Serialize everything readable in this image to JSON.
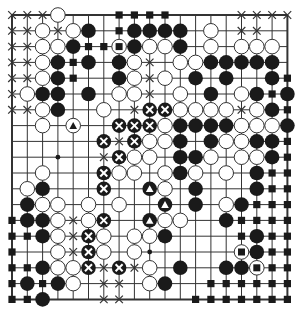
{
  "board": {
    "size": 19,
    "origin_x": 12,
    "origin_y": 15,
    "step_x": 15.3,
    "step_y": 15.8,
    "stone_radius": 7.3,
    "colors": {
      "line": "#333333",
      "black_stone": "#1a1a1a",
      "white_stone": "#ffffff",
      "stone_outline": "#333333",
      "background": "#ffffff"
    },
    "legend": {
      "W": "white stone",
      "B": "black stone",
      "X": "cross mark on empty point",
      "S": "black square on empty point",
      "D": "star point dot",
      "BX": "black stone marked with white X",
      "WT": "white stone marked with black triangle",
      "BT": "black stone marked with white triangle",
      "WS": "white stone marked with black square"
    },
    "rows": [
      {
        "row": 0,
        "points": [
          [
            0,
            "X"
          ],
          [
            1,
            "X"
          ],
          [
            2,
            "X"
          ],
          [
            3,
            "W"
          ],
          [
            7,
            "S"
          ],
          [
            8,
            "S"
          ],
          [
            9,
            "S"
          ],
          [
            10,
            "S"
          ],
          [
            15,
            "X"
          ],
          [
            16,
            "X"
          ],
          [
            17,
            "X"
          ],
          [
            18,
            "X"
          ]
        ]
      },
      {
        "row": 1,
        "points": [
          [
            0,
            "X"
          ],
          [
            1,
            "X"
          ],
          [
            2,
            "W"
          ],
          [
            3,
            "X"
          ],
          [
            4,
            "W"
          ],
          [
            5,
            "B"
          ],
          [
            7,
            "S"
          ],
          [
            8,
            "B"
          ],
          [
            9,
            "B"
          ],
          [
            10,
            "B"
          ],
          [
            11,
            "B"
          ],
          [
            13,
            "W"
          ],
          [
            15,
            "X"
          ],
          [
            16,
            "X"
          ]
        ]
      },
      {
        "row": 2,
        "points": [
          [
            0,
            "X"
          ],
          [
            1,
            "X"
          ],
          [
            2,
            "W"
          ],
          [
            3,
            "W"
          ],
          [
            4,
            "B"
          ],
          [
            5,
            "S"
          ],
          [
            6,
            "S"
          ],
          [
            7,
            "WS"
          ],
          [
            8,
            "B"
          ],
          [
            9,
            "W"
          ],
          [
            10,
            "W"
          ],
          [
            11,
            "B"
          ],
          [
            13,
            "W"
          ],
          [
            15,
            "W"
          ],
          [
            16,
            "W"
          ],
          [
            17,
            "W"
          ]
        ]
      },
      {
        "row": 3,
        "points": [
          [
            0,
            "X"
          ],
          [
            1,
            "X"
          ],
          [
            2,
            "W"
          ],
          [
            3,
            "B"
          ],
          [
            4,
            "S"
          ],
          [
            5,
            "B"
          ],
          [
            7,
            "B"
          ],
          [
            8,
            "W"
          ],
          [
            9,
            "X"
          ],
          [
            11,
            "W"
          ],
          [
            12,
            "W"
          ],
          [
            13,
            "B"
          ],
          [
            14,
            "B"
          ],
          [
            15,
            "B"
          ],
          [
            16,
            "B"
          ],
          [
            17,
            "B"
          ]
        ]
      },
      {
        "row": 4,
        "points": [
          [
            0,
            "X"
          ],
          [
            1,
            "X"
          ],
          [
            2,
            "W"
          ],
          [
            3,
            "B"
          ],
          [
            4,
            "S"
          ],
          [
            7,
            "B"
          ],
          [
            8,
            "W"
          ],
          [
            9,
            "X"
          ],
          [
            10,
            "W"
          ],
          [
            12,
            "B"
          ],
          [
            14,
            "B"
          ],
          [
            17,
            "B"
          ],
          [
            18,
            "S"
          ]
        ]
      },
      {
        "row": 5,
        "points": [
          [
            0,
            "X"
          ],
          [
            1,
            "W"
          ],
          [
            2,
            "B"
          ],
          [
            3,
            "B"
          ],
          [
            5,
            "B"
          ],
          [
            7,
            "W"
          ],
          [
            8,
            "W"
          ],
          [
            9,
            "X"
          ],
          [
            11,
            "W"
          ],
          [
            13,
            "B"
          ],
          [
            15,
            "W"
          ],
          [
            16,
            "B"
          ],
          [
            17,
            "S"
          ],
          [
            18,
            "B"
          ]
        ]
      },
      {
        "row": 6,
        "points": [
          [
            0,
            "X"
          ],
          [
            1,
            "X"
          ],
          [
            2,
            "W"
          ],
          [
            3,
            "B"
          ],
          [
            6,
            "W"
          ],
          [
            8,
            "X"
          ],
          [
            9,
            "BX"
          ],
          [
            10,
            "BX"
          ],
          [
            11,
            "W"
          ],
          [
            12,
            "W"
          ],
          [
            13,
            "W"
          ],
          [
            14,
            "W"
          ],
          [
            15,
            "X"
          ],
          [
            16,
            "W"
          ],
          [
            17,
            "B"
          ],
          [
            18,
            "S"
          ]
        ]
      },
      {
        "row": 7,
        "points": [
          [
            2,
            "W"
          ],
          [
            4,
            "WT"
          ],
          [
            7,
            "BX"
          ],
          [
            8,
            "BX"
          ],
          [
            9,
            "BX"
          ],
          [
            10,
            "W"
          ],
          [
            11,
            "B"
          ],
          [
            12,
            "B"
          ],
          [
            13,
            "B"
          ],
          [
            14,
            "B"
          ],
          [
            15,
            "W"
          ],
          [
            16,
            "W"
          ],
          [
            17,
            "W"
          ],
          [
            18,
            "B"
          ]
        ]
      },
      {
        "row": 8,
        "points": [
          [
            6,
            "BX"
          ],
          [
            7,
            "X"
          ],
          [
            8,
            "BX"
          ],
          [
            9,
            "W"
          ],
          [
            10,
            "W"
          ],
          [
            11,
            "B"
          ],
          [
            13,
            "B"
          ],
          [
            14,
            "W"
          ],
          [
            15,
            "W"
          ],
          [
            16,
            "B"
          ],
          [
            17,
            "B"
          ],
          [
            18,
            "S"
          ]
        ]
      },
      {
        "row": 9,
        "points": [
          [
            3,
            "D"
          ],
          [
            6,
            "X"
          ],
          [
            7,
            "BX"
          ],
          [
            8,
            "W"
          ],
          [
            9,
            "W"
          ],
          [
            11,
            "B"
          ],
          [
            12,
            "B"
          ],
          [
            13,
            "W"
          ],
          [
            15,
            "W"
          ],
          [
            16,
            "W"
          ],
          [
            17,
            "B"
          ],
          [
            18,
            "S"
          ]
        ]
      },
      {
        "row": 10,
        "points": [
          [
            2,
            "W"
          ],
          [
            6,
            "BX"
          ],
          [
            7,
            "W"
          ],
          [
            8,
            "W"
          ],
          [
            10,
            "W"
          ],
          [
            11,
            "B"
          ],
          [
            12,
            "W"
          ],
          [
            14,
            "W"
          ],
          [
            16,
            "B"
          ],
          [
            17,
            "S"
          ],
          [
            18,
            "S"
          ]
        ]
      },
      {
        "row": 11,
        "points": [
          [
            1,
            "W"
          ],
          [
            2,
            "B"
          ],
          [
            6,
            "BX"
          ],
          [
            9,
            "BT"
          ],
          [
            10,
            "W"
          ],
          [
            12,
            "B"
          ],
          [
            16,
            "B"
          ],
          [
            17,
            "S"
          ],
          [
            18,
            "S"
          ]
        ]
      },
      {
        "row": 12,
        "points": [
          [
            1,
            "B"
          ],
          [
            2,
            "W"
          ],
          [
            3,
            "W"
          ],
          [
            5,
            "W"
          ],
          [
            7,
            "W"
          ],
          [
            10,
            "BT"
          ],
          [
            12,
            "B"
          ],
          [
            14,
            "W"
          ],
          [
            15,
            "B"
          ],
          [
            16,
            "S"
          ],
          [
            17,
            "S"
          ],
          [
            18,
            "S"
          ]
        ]
      },
      {
        "row": 13,
        "points": [
          [
            0,
            "S"
          ],
          [
            1,
            "B"
          ],
          [
            2,
            "B"
          ],
          [
            3,
            "W"
          ],
          [
            4,
            "X"
          ],
          [
            5,
            "W"
          ],
          [
            6,
            "BX"
          ],
          [
            9,
            "BT"
          ],
          [
            10,
            "W"
          ],
          [
            11,
            "W"
          ],
          [
            14,
            "B"
          ],
          [
            15,
            "S"
          ],
          [
            16,
            "S"
          ],
          [
            17,
            "S"
          ],
          [
            18,
            "S"
          ]
        ]
      },
      {
        "row": 14,
        "points": [
          [
            0,
            "S"
          ],
          [
            1,
            "S"
          ],
          [
            2,
            "B"
          ],
          [
            3,
            "W"
          ],
          [
            4,
            "X"
          ],
          [
            5,
            "BX"
          ],
          [
            6,
            "W"
          ],
          [
            8,
            "W"
          ],
          [
            9,
            "W"
          ],
          [
            10,
            "B"
          ],
          [
            15,
            "S"
          ],
          [
            16,
            "B"
          ],
          [
            17,
            "S"
          ],
          [
            18,
            "S"
          ]
        ]
      },
      {
        "row": 15,
        "points": [
          [
            0,
            "S"
          ],
          [
            3,
            "W"
          ],
          [
            4,
            "X"
          ],
          [
            5,
            "BX"
          ],
          [
            6,
            "W"
          ],
          [
            8,
            "W"
          ],
          [
            9,
            "D"
          ],
          [
            15,
            "WS"
          ],
          [
            16,
            "B"
          ],
          [
            17,
            "S"
          ],
          [
            18,
            "S"
          ]
        ]
      },
      {
        "row": 16,
        "points": [
          [
            0,
            "S"
          ],
          [
            1,
            "S"
          ],
          [
            2,
            "B"
          ],
          [
            3,
            "W"
          ],
          [
            4,
            "W"
          ],
          [
            5,
            "BX"
          ],
          [
            6,
            "X"
          ],
          [
            7,
            "BX"
          ],
          [
            8,
            "X"
          ],
          [
            9,
            "W"
          ],
          [
            11,
            "B"
          ],
          [
            14,
            "B"
          ],
          [
            15,
            "B"
          ],
          [
            16,
            "WS"
          ],
          [
            17,
            "S"
          ],
          [
            18,
            "S"
          ]
        ]
      },
      {
        "row": 17,
        "points": [
          [
            0,
            "S"
          ],
          [
            1,
            "B"
          ],
          [
            2,
            "S"
          ],
          [
            3,
            "B"
          ],
          [
            4,
            "W"
          ],
          [
            6,
            "X"
          ],
          [
            7,
            "X"
          ],
          [
            9,
            "W"
          ],
          [
            10,
            "B"
          ],
          [
            13,
            "S"
          ],
          [
            14,
            "S"
          ],
          [
            15,
            "S"
          ],
          [
            16,
            "S"
          ],
          [
            17,
            "S"
          ],
          [
            18,
            "S"
          ]
        ]
      },
      {
        "row": 18,
        "points": [
          [
            0,
            "S"
          ],
          [
            1,
            "S"
          ],
          [
            2,
            "B"
          ],
          [
            6,
            "X"
          ],
          [
            7,
            "X"
          ],
          [
            12,
            "S"
          ],
          [
            13,
            "S"
          ],
          [
            14,
            "S"
          ],
          [
            15,
            "S"
          ],
          [
            16,
            "S"
          ],
          [
            17,
            "S"
          ],
          [
            18,
            "S"
          ]
        ]
      }
    ]
  }
}
